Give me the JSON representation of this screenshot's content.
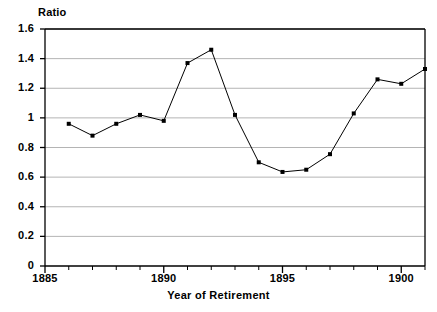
{
  "chart_data": {
    "type": "line",
    "title": "",
    "xlabel": "Year of Retirement",
    "ylabel": "Ratio",
    "xlim": [
      1885,
      1901
    ],
    "ylim": [
      0,
      1.6
    ],
    "grid": true,
    "legend": false,
    "x": [
      1886,
      1887,
      1888,
      1889,
      1890,
      1891,
      1892,
      1893,
      1894,
      1895,
      1896,
      1897,
      1898,
      1899,
      1900,
      1901
    ],
    "values": [
      0.96,
      0.88,
      0.96,
      1.02,
      0.98,
      1.37,
      1.46,
      1.02,
      0.7,
      0.635,
      0.65,
      0.755,
      1.03,
      1.26,
      1.23,
      1.33
    ],
    "series": [
      {
        "name": "Ratio",
        "values": [
          0.96,
          0.88,
          0.96,
          1.02,
          0.98,
          1.37,
          1.46,
          1.02,
          0.7,
          0.635,
          0.65,
          0.755,
          1.03,
          1.26,
          1.23,
          1.33
        ]
      }
    ],
    "x_major_ticks": [
      1885,
      1890,
      1895,
      1900
    ],
    "x_tick_labels": [
      "1885",
      "1890",
      "1895",
      "1900"
    ],
    "x_minor_ticks": [
      1886,
      1887,
      1888,
      1889,
      1891,
      1892,
      1893,
      1894,
      1896,
      1897,
      1898,
      1899,
      1901
    ],
    "y_ticks": [
      0,
      0.2,
      0.4,
      0.6,
      0.8,
      1.0,
      1.2,
      1.4,
      1.6
    ],
    "y_tick_labels": [
      "0",
      "0.2",
      "0.4",
      "0.6",
      "0.8",
      "1",
      "1.2",
      "1.4",
      "1.6"
    ],
    "marker": "square",
    "line_color": "#000000",
    "marker_color": "#000000",
    "grid_color": "#b4b4b4",
    "axis_color": "#000000",
    "background": "#ffffff"
  }
}
